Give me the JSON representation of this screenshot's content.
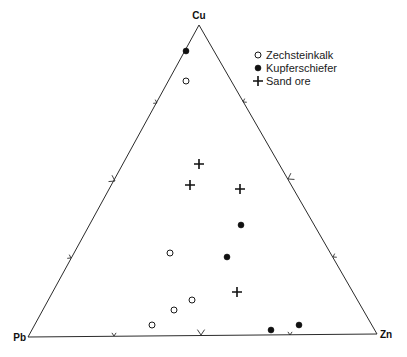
{
  "diagram": {
    "type": "ternary",
    "vertices": {
      "top": {
        "label": "Cu",
        "x": 199,
        "y": 25
      },
      "left": {
        "label": "Pb",
        "x": 28,
        "y": 337
      },
      "right": {
        "label": "Zn",
        "x": 377,
        "y": 334
      }
    },
    "legend": [
      {
        "symbol": "open-circle",
        "label": "Zechsteinkalk"
      },
      {
        "symbol": "filled-circle",
        "label": "Kupferschiefer"
      },
      {
        "symbol": "plus",
        "label": "Sand ore"
      }
    ],
    "ticks": {
      "left_edge": [
        {
          "x": 157,
          "y": 103,
          "size": "small"
        },
        {
          "x": 115,
          "y": 181,
          "size": "medium"
        },
        {
          "x": 71,
          "y": 258,
          "size": "small"
        }
      ],
      "right_edge": [
        {
          "x": 243,
          "y": 102,
          "size": "small"
        },
        {
          "x": 288,
          "y": 179,
          "size": "medium"
        },
        {
          "x": 333,
          "y": 257,
          "size": "small"
        }
      ],
      "base_edge": [
        {
          "x": 114,
          "y": 336,
          "size": "small"
        },
        {
          "x": 201,
          "y": 335,
          "size": "medium"
        },
        {
          "x": 290,
          "y": 335,
          "size": "small"
        }
      ]
    },
    "points": [
      {
        "series": "Kupferschiefer",
        "x": 186,
        "y": 51
      },
      {
        "series": "Zechsteinkalk",
        "x": 186,
        "y": 81
      },
      {
        "series": "Sand ore",
        "x": 199,
        "y": 164
      },
      {
        "series": "Sand ore",
        "x": 190,
        "y": 185
      },
      {
        "series": "Sand ore",
        "x": 240,
        "y": 189
      },
      {
        "series": "Kupferschiefer",
        "x": 241,
        "y": 225
      },
      {
        "series": "Zechsteinkalk",
        "x": 170,
        "y": 253
      },
      {
        "series": "Kupferschiefer",
        "x": 227,
        "y": 257
      },
      {
        "series": "Sand ore",
        "x": 237,
        "y": 292
      },
      {
        "series": "Zechsteinkalk",
        "x": 192,
        "y": 300
      },
      {
        "series": "Zechsteinkalk",
        "x": 174,
        "y": 310
      },
      {
        "series": "Zechsteinkalk",
        "x": 152,
        "y": 325
      },
      {
        "series": "Kupferschiefer",
        "x": 299,
        "y": 325
      },
      {
        "series": "Kupferschiefer",
        "x": 271,
        "y": 330
      }
    ]
  }
}
